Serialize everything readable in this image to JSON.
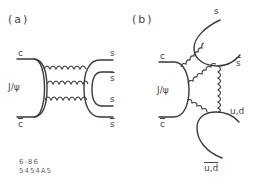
{
  "panel_a": {
    "label": "(a)",
    "quark_top": "c",
    "quark_bottom": "c",
    "meson": "J/ψ",
    "outputs": [
      "s",
      "s",
      "s",
      "s"
    ],
    "outputs_bar": [
      false,
      true,
      false,
      true
    ],
    "gluon_count": 3
  },
  "panel_b": {
    "label": "(b)",
    "quark_top": "c",
    "quark_bottom": "c",
    "meson": "J/ψ",
    "out_s": "s",
    "out_sbar": "s",
    "out_ud": "u,d",
    "out_udbar": "u,d"
  },
  "figure_id": {
    "line1": "6-86",
    "line2": "5454A5"
  },
  "colors": {
    "line": "#3a3a3a",
    "background": "#ffffff"
  }
}
